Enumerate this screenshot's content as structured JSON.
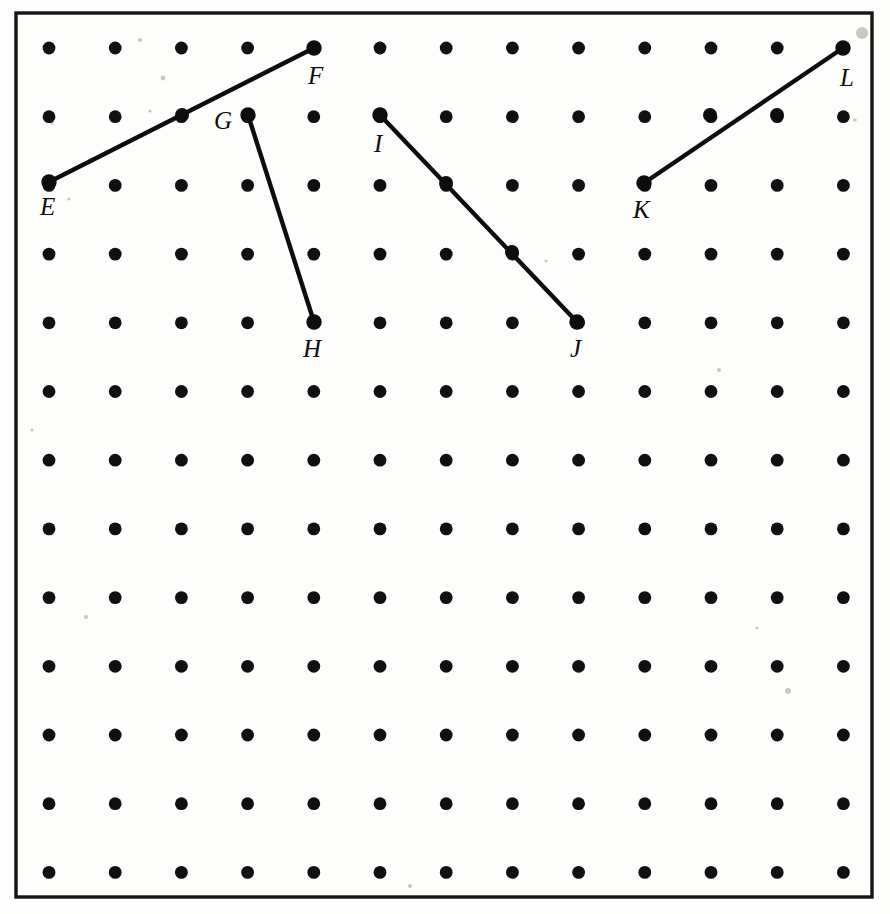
{
  "figure": {
    "kind": "dot-grid-geometry-figure",
    "background_color": "#fdfdfc",
    "ink_color": "#0d0d0d"
  },
  "frame": {
    "x": 16,
    "y": 13,
    "width": 856,
    "height": 884,
    "stroke_color": "#151515",
    "stroke_width": 3.4
  },
  "grid": {
    "columns": 13,
    "rows": 13,
    "origin_x": 49,
    "origin_y": 48,
    "spacing_x": 66.2,
    "spacing_y": 68.7,
    "dot_radius": 6.4,
    "dot_color": "#101010",
    "total_dots": 169
  },
  "points": [
    {
      "label": "E",
      "col": 0,
      "row": 2,
      "x": 49,
      "y": 182,
      "label_x": 40,
      "label_y": 215,
      "label_anchor": "start"
    },
    {
      "label": "F",
      "col": 4,
      "row": 0,
      "x": 314,
      "y": 48,
      "label_x": 308,
      "label_y": 84,
      "label_anchor": "start"
    },
    {
      "label": "G",
      "col": 3,
      "row": 1,
      "x": 248,
      "y": 115,
      "label_x": 232,
      "label_y": 129,
      "label_anchor": "end"
    },
    {
      "label": "H",
      "col": 4,
      "row": 4,
      "x": 314,
      "y": 322,
      "label_x": 303,
      "label_y": 357,
      "label_anchor": "start"
    },
    {
      "label": "I",
      "col": 5,
      "row": 1,
      "x": 380,
      "y": 115,
      "label_x": 374,
      "label_y": 152,
      "label_anchor": "start"
    },
    {
      "label": "J",
      "col": 8,
      "row": 4,
      "x": 577,
      "y": 322,
      "label_x": 570,
      "label_y": 357,
      "label_anchor": "start"
    },
    {
      "label": "K",
      "col": 9,
      "row": 2,
      "x": 644,
      "y": 183,
      "label_x": 633,
      "label_y": 218,
      "label_anchor": "start"
    },
    {
      "label": "L",
      "col": 12,
      "row": 0,
      "x": 843,
      "y": 48,
      "label_x": 840,
      "label_y": 86,
      "label_anchor": "start"
    }
  ],
  "segments": [
    {
      "name": "EF",
      "from": "E",
      "to": "F",
      "x1": 49,
      "y1": 182,
      "x2": 314,
      "y2": 48,
      "passes_through_dots": [
        {
          "col": 2,
          "row": 1,
          "x": 182,
          "y": 115
        }
      ],
      "rise": -2,
      "run": 4,
      "stroke_width": 4.4
    },
    {
      "name": "GH",
      "from": "G",
      "to": "H",
      "x1": 248,
      "y1": 115,
      "x2": 314,
      "y2": 322,
      "passes_through_dots": [],
      "rise": 3,
      "run": 1,
      "stroke_width": 4.4
    },
    {
      "name": "IJ",
      "from": "I",
      "to": "J",
      "x1": 380,
      "y1": 115,
      "x2": 577,
      "y2": 322,
      "passes_through_dots": [
        {
          "col": 6,
          "row": 2,
          "x": 446,
          "y": 183
        },
        {
          "col": 7,
          "row": 3,
          "x": 512,
          "y": 252
        }
      ],
      "rise": 3,
      "run": 3,
      "stroke_width": 4.4
    },
    {
      "name": "KL",
      "from": "K",
      "to": "L",
      "x1": 644,
      "y1": 183,
      "x2": 843,
      "y2": 48,
      "passes_through_dots": [
        {
          "col": 10,
          "row": 1,
          "x": 710,
          "y": 115
        },
        {
          "col": 11,
          "row": 1,
          "x": 777,
          "y": 115
        }
      ],
      "rise": -2,
      "run": 3,
      "stroke_width": 4.4
    }
  ],
  "specks": [
    {
      "x": 140,
      "y": 40,
      "r": 2.0
    },
    {
      "x": 163,
      "y": 78,
      "r": 2.4
    },
    {
      "x": 150,
      "y": 111,
      "r": 1.6
    },
    {
      "x": 52,
      "y": 123,
      "r": 1.7
    },
    {
      "x": 69,
      "y": 199,
      "r": 1.6
    },
    {
      "x": 862,
      "y": 33,
      "r": 6.0
    },
    {
      "x": 855,
      "y": 120,
      "r": 1.8
    },
    {
      "x": 719,
      "y": 370,
      "r": 2.0
    },
    {
      "x": 788,
      "y": 691,
      "r": 3.0
    },
    {
      "x": 32,
      "y": 430,
      "r": 1.6
    },
    {
      "x": 86,
      "y": 617,
      "r": 2.1
    },
    {
      "x": 410,
      "y": 886,
      "r": 2.0
    },
    {
      "x": 546,
      "y": 261,
      "r": 1.5
    },
    {
      "x": 757,
      "y": 628,
      "r": 1.5
    }
  ]
}
